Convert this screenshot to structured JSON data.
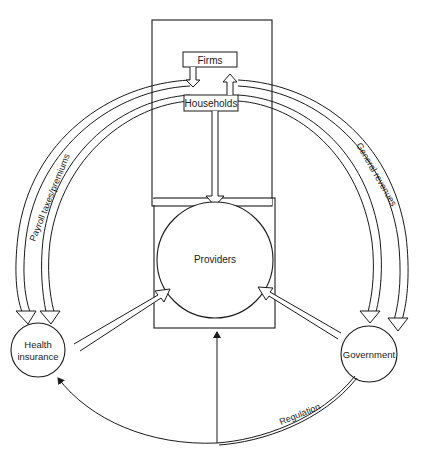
{
  "diagram": {
    "nodes": {
      "firms": "Firms",
      "households": "Households",
      "providers": "Providers",
      "health_insurance_line1": "Health",
      "health_insurance_line2": "insurance",
      "government": "Government"
    },
    "flows": {
      "payroll": "Payroll taxes/premiums",
      "general_revenues": "General revenues",
      "regulation": "Regulation"
    },
    "colors": {
      "stroke": "#1a1a1a",
      "background": "#ffffff"
    }
  }
}
